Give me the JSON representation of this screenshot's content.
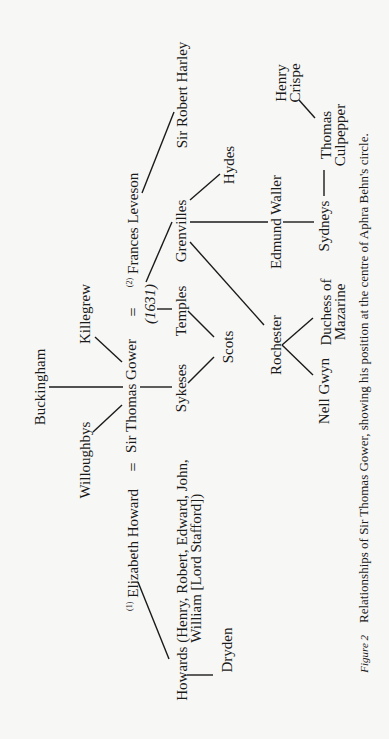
{
  "diagram": {
    "type": "family-relationship-tree",
    "orientation": "rotated-90-ccw",
    "nodes": {
      "buckingham": "Buckingham",
      "killegrew": "Killegrew",
      "willoughbys": "Willoughbys",
      "sir_thomas_gower": "Sir Thomas Gower",
      "equals_first": "=",
      "equals_second": "=",
      "elizabeth_howard_marker": "(1)",
      "elizabeth_howard": "Elizabeth Howard",
      "frances_leveson_marker": "(2)",
      "frances_leveson": "Frances Leveson",
      "marriage_year": "(1631)",
      "sir_robert_harley": "Sir Robert Harley",
      "grenvilles": "Grenvilles",
      "hydes": "Hydes",
      "temples": "Temples",
      "sykeses": "Sykeses",
      "scots": "Scots",
      "edmund_waller": "Edmund Waller",
      "rochester": "Rochester",
      "sydneys": "Sydneys",
      "thomas_culpepper_line1": "Thomas",
      "thomas_culpepper_line2": "Culpepper",
      "henry_crispe_line1": "Henry",
      "henry_crispe_line2": "Crispe",
      "duchess_line1": "Duchess of",
      "duchess_line2": "Mazarine",
      "nell_gwyn": "Nell Gwyn",
      "howards_line1": "Howards (Henry, Robert, Edward, John,",
      "howards_line2": "William [Lord Stafford])",
      "dryden": "Dryden"
    },
    "edges": [
      [
        "Sir Thomas Gower",
        "Buckingham"
      ],
      [
        "Sir Thomas Gower",
        "Killegrew"
      ],
      [
        "Sir Thomas Gower",
        "Willoughbys"
      ],
      [
        "Sir Thomas Gower",
        "Sykeses"
      ],
      [
        "Sir Thomas Gower",
        "Elizabeth Howard",
        "marriage (1)"
      ],
      [
        "Sir Thomas Gower",
        "Frances Leveson",
        "marriage (2) 1631"
      ],
      [
        "Frances Leveson",
        "Sir Robert Harley"
      ],
      [
        "Frances Leveson",
        "Grenvilles"
      ],
      [
        "(1631)",
        "Temples"
      ],
      [
        "Temples",
        "Scots"
      ],
      [
        "Sykeses",
        "Scots"
      ],
      [
        "Grenvilles",
        "Hydes"
      ],
      [
        "Grenvilles",
        "Edmund Waller"
      ],
      [
        "Grenvilles",
        "Rochester"
      ],
      [
        "Edmund Waller",
        "Sydneys"
      ],
      [
        "Sydneys",
        "Thomas Culpepper"
      ],
      [
        "Thomas Culpepper",
        "Henry Crispe"
      ],
      [
        "Rochester",
        "Duchess of Mazarine"
      ],
      [
        "Rochester",
        "Nell Gwyn"
      ],
      [
        "Elizabeth Howard",
        "Howards"
      ],
      [
        "Howards",
        "Dryden"
      ]
    ]
  },
  "caption": {
    "figure_label": "Figure 2",
    "text": "Relationships of Sir Thomas Gower, showing his position at the centre of Aphra Behn's circle."
  }
}
